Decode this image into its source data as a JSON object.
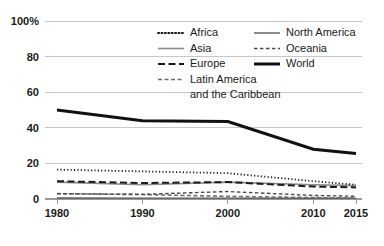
{
  "chart_data": {
    "type": "line",
    "title": "",
    "subtitle": "",
    "xlabel": "",
    "ylabel": "",
    "x": [
      1980,
      1990,
      2000,
      2010,
      2015
    ],
    "xtick_labels": [
      "1980",
      "1990",
      "2000",
      "2010",
      "2015"
    ],
    "ytick_labels": [
      "0",
      "20",
      "40",
      "60",
      "80",
      "100%"
    ],
    "ytick_values": [
      0,
      20,
      40,
      60,
      80,
      100
    ],
    "ylim": [
      0,
      100
    ],
    "grid": true,
    "legend_position": "top-center",
    "series": [
      {
        "name": "Africa",
        "style": "dotted",
        "color": "#1a1a1a",
        "width": 1.8,
        "dash": "1.2 2.2",
        "values": [
          16.5,
          15.5,
          14.5,
          10.0,
          8.0
        ]
      },
      {
        "name": "Asia",
        "style": "solid-gray",
        "color": "#8a8a8a",
        "width": 1.6,
        "dash": "none",
        "values": [
          9.5,
          8.0,
          9.5,
          8.0,
          7.5
        ]
      },
      {
        "name": "Europe",
        "style": "long-dash",
        "color": "#1a1a1a",
        "width": 2.0,
        "dash": "7 3.5",
        "values": [
          10.0,
          9.0,
          9.5,
          7.0,
          6.5
        ]
      },
      {
        "name": "Latin America and the Caribbean",
        "style": "dashed",
        "color": "#6e6e6e",
        "width": 1.6,
        "dash": "4 2.5",
        "values": [
          3.0,
          2.5,
          1.5,
          0.8,
          0.5
        ]
      },
      {
        "name": "North America",
        "style": "solid-thin",
        "color": "#5a5a5a",
        "width": 1.4,
        "dash": "none",
        "values": [
          0.6,
          0.5,
          0.5,
          0.4,
          0.4
        ]
      },
      {
        "name": "Oceania",
        "style": "short-dash",
        "color": "#4a4a4a",
        "width": 1.4,
        "dash": "3.5 2.5",
        "values": [
          3.0,
          2.6,
          4.2,
          2.0,
          1.5
        ]
      },
      {
        "name": "World",
        "style": "solid-thick",
        "color": "#111111",
        "width": 3.0,
        "dash": "none",
        "values": [
          50.0,
          44.0,
          43.5,
          28.0,
          25.5
        ]
      }
    ]
  },
  "legend": {
    "entries": [
      {
        "label": "Africa",
        "series": "Africa"
      },
      {
        "label": "Asia",
        "series": "Asia"
      },
      {
        "label": "Europe",
        "series": "Europe"
      },
      {
        "label": "Latin America",
        "series": "Latin America and the Caribbean"
      },
      {
        "label": "and the Caribbean",
        "series": "Latin America and the Caribbean"
      },
      {
        "label": "North America",
        "series": "North America"
      },
      {
        "label": "Oceania",
        "series": "Oceania"
      },
      {
        "label": "World",
        "series": "World"
      }
    ]
  }
}
